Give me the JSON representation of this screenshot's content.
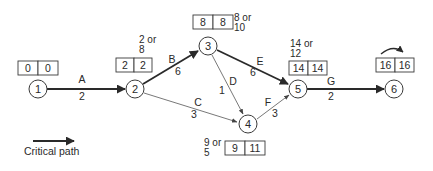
{
  "colors": {
    "line": "#2a2a2a",
    "critical": "#2a2a2a",
    "noncritical": "#555555",
    "background": "#ffffff"
  },
  "nodes": [
    {
      "id": "1",
      "label": "1",
      "cx": 38,
      "cy": 89
    },
    {
      "id": "2",
      "label": "2",
      "cx": 135,
      "cy": 89
    },
    {
      "id": "3",
      "label": "3",
      "cx": 208,
      "cy": 46
    },
    {
      "id": "4",
      "label": "4",
      "cx": 248,
      "cy": 124
    },
    {
      "id": "5",
      "label": "5",
      "cx": 298,
      "cy": 89
    },
    {
      "id": "6",
      "label": "6",
      "cx": 394,
      "cy": 89
    }
  ],
  "activities": [
    {
      "name": "A",
      "duration": "2",
      "from": "1",
      "to": "2",
      "critical": true
    },
    {
      "name": "B",
      "duration": "6",
      "from": "2",
      "to": "3",
      "critical": true
    },
    {
      "name": "C",
      "duration": "3",
      "from": "2",
      "to": "4",
      "critical": false
    },
    {
      "name": "D",
      "duration": "1",
      "from": "3",
      "to": "4",
      "critical": false
    },
    {
      "name": "E",
      "duration": "6",
      "from": "3",
      "to": "5",
      "critical": true
    },
    {
      "name": "F",
      "duration": "3",
      "from": "4",
      "to": "5",
      "critical": false
    },
    {
      "name": "G",
      "duration": "2",
      "from": "5",
      "to": "6",
      "critical": true
    }
  ],
  "time_boxes": [
    {
      "node": "1",
      "earliest": "0",
      "latest": "0"
    },
    {
      "node": "2",
      "earliest": "2",
      "latest": "2"
    },
    {
      "node": "3",
      "earliest": "8",
      "latest": "8"
    },
    {
      "node": "4",
      "earliest": "9",
      "latest": "11"
    },
    {
      "node": "5",
      "earliest": "14",
      "latest": "14"
    },
    {
      "node": "6",
      "earliest": "16",
      "latest": "16"
    }
  ],
  "notes": {
    "node2": {
      "line1": "2 or",
      "line2": "8"
    },
    "node3": {
      "line1": "8 or",
      "line2": "10"
    },
    "node4": {
      "line1": "9 or",
      "line2": "5"
    },
    "node5": {
      "line1": "14 or",
      "line2": "12"
    }
  },
  "legend": {
    "label": "Critical path"
  }
}
